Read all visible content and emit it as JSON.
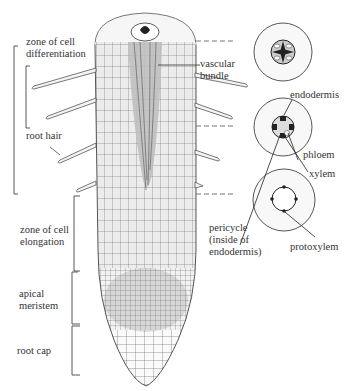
{
  "diagram": {
    "left_labels": {
      "zone_differentiation": "zone of cell\ndifferentiation",
      "root_hair": "root hair",
      "zone_elongation": "zone of cell\nelongation",
      "apical_meristem": "apical\nmeristem",
      "root_cap": "root cap"
    },
    "center_labels": {
      "vascular_bundle": "vascular\nbundle"
    },
    "right_labels": {
      "endodermis": "endodermis",
      "phloem": "phloem",
      "xylem": "xylem",
      "pericycle": "pericycle\n(inside of\nendodermis)",
      "protoxylem": "protoxylem"
    },
    "colors": {
      "line": "#444444",
      "tissue_fill": "#e6e6e6",
      "vascular_fill": "#bdbdbd",
      "dark": "#222222"
    }
  }
}
